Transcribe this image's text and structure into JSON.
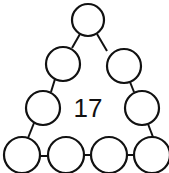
{
  "puzzle": {
    "center_label": "17",
    "circles": [
      {
        "id": "top",
        "cx": 88,
        "cy": 20,
        "r": 16,
        "value": ""
      },
      {
        "id": "left-2",
        "cx": 63,
        "cy": 64,
        "r": 17,
        "value": ""
      },
      {
        "id": "right-2",
        "cx": 124,
        "cy": 66,
        "r": 17,
        "value": ""
      },
      {
        "id": "left-3",
        "cx": 43,
        "cy": 108,
        "r": 17,
        "value": ""
      },
      {
        "id": "right-3",
        "cx": 142,
        "cy": 108,
        "r": 17,
        "value": ""
      },
      {
        "id": "bottom-1",
        "cx": 22,
        "cy": 155,
        "r": 18,
        "value": ""
      },
      {
        "id": "bottom-2",
        "cx": 66,
        "cy": 155,
        "r": 18,
        "value": ""
      },
      {
        "id": "bottom-3",
        "cx": 109,
        "cy": 155,
        "r": 18,
        "value": ""
      },
      {
        "id": "bottom-4",
        "cx": 152,
        "cy": 155,
        "r": 18,
        "value": ""
      }
    ],
    "colors": {
      "stroke": "#111111",
      "fill": "#ffffff",
      "background": "#ffffff"
    }
  }
}
